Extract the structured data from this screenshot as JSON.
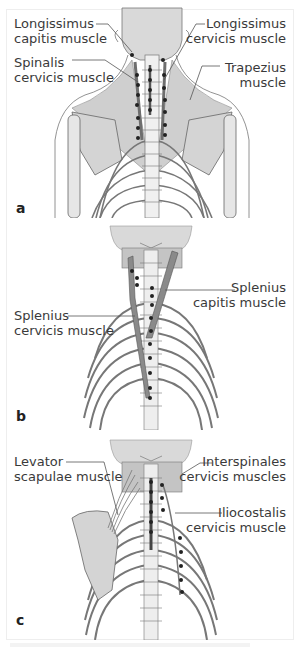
{
  "figure": {
    "colors": {
      "bone": "#e6e6e6",
      "bone_outline": "#555555",
      "muscle": "#9a9a9a",
      "muscle_dark": "#6e6e6e",
      "head": "#d9d9d9",
      "attachment_dot": "#222222",
      "text": "#3a3a3a"
    },
    "panels": [
      {
        "letter": "a",
        "labels": [
          {
            "text": "Longissimus\ncapitis muscle",
            "side": "left"
          },
          {
            "text": "Spinalis\ncervicis muscle",
            "side": "left"
          },
          {
            "text": "Longissimus\ncervicis muscle",
            "side": "right"
          },
          {
            "text": "Trapezius\nmuscle",
            "side": "right"
          }
        ]
      },
      {
        "letter": "b",
        "labels": [
          {
            "text": "Splenius\ncapitis muscle",
            "side": "right"
          },
          {
            "text": "Splenius\ncervicis muscle",
            "side": "left"
          }
        ]
      },
      {
        "letter": "c",
        "labels": [
          {
            "text": "Levator\nscapulae muscle",
            "side": "left"
          },
          {
            "text": "Interspinales\ncervicis muscles",
            "side": "right"
          },
          {
            "text": "Iliocostalis\ncervicis muscle",
            "side": "right"
          }
        ]
      }
    ]
  }
}
